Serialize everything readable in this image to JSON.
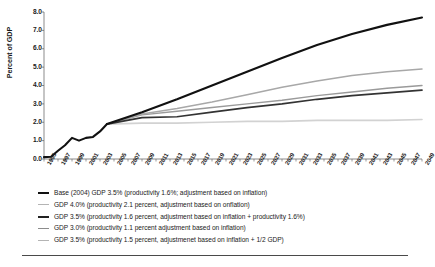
{
  "chart_data": {
    "type": "line",
    "title": "",
    "xlabel": "",
    "ylabel": "Percent of GDP",
    "ylim": [
      0.0,
      8.0
    ],
    "ytick_values": [
      0.0,
      1.0,
      2.0,
      3.0,
      4.0,
      5.0,
      6.0,
      7.0,
      8.0
    ],
    "ytick_labels": [
      "0.0",
      "1.0",
      "2.0",
      "3.0",
      "4.0",
      "5.0",
      "6.0",
      "7.0",
      "8.0"
    ],
    "xlim": [
      1995,
      2049
    ],
    "xtick_labels": [
      "1995",
      "1997",
      "1999",
      "2001",
      "2003",
      "2005",
      "2007",
      "2009",
      "2011",
      "2013",
      "2015",
      "2017",
      "2019",
      "2021",
      "2023",
      "2025",
      "2027",
      "2029",
      "2031",
      "2033",
      "2035",
      "2037",
      "2039",
      "2041",
      "2043",
      "2045",
      "2047",
      "2049"
    ],
    "grid": false,
    "legend_position": "below",
    "historical": {
      "name": "historical",
      "x": [
        1995,
        1996,
        1997,
        1998,
        1999,
        2000,
        2001,
        2002,
        2003,
        2004
      ],
      "values": [
        0.1,
        0.12,
        0.45,
        0.75,
        1.15,
        1.0,
        1.15,
        1.2,
        1.5,
        1.9
      ]
    },
    "series": [
      {
        "name": "Base (2004) GDP 3.5% (productivity 1.6%; adjustment based on inflation)",
        "color": "#111111",
        "width": 2.1,
        "x": [
          2004,
          2009,
          2014,
          2019,
          2024,
          2029,
          2034,
          2039,
          2044,
          2049
        ],
        "values": [
          1.9,
          2.55,
          3.25,
          4.0,
          4.75,
          5.5,
          6.2,
          6.8,
          7.3,
          7.7
        ]
      },
      {
        "name": "GDP 4.0% (productivity 2.1 percent, adjustment based on onflation)",
        "color": "#a8a8a8",
        "width": 1.5,
        "x": [
          2004,
          2009,
          2014,
          2019,
          2024,
          2029,
          2034,
          2039,
          2044,
          2049
        ],
        "values": [
          1.9,
          2.45,
          2.75,
          3.1,
          3.5,
          3.9,
          4.25,
          4.55,
          4.75,
          4.9
        ]
      },
      {
        "name": "GDP 3.5% (productivity 1.6 percent, adjustment based on inflation + productivity 1.6%)",
        "color": "#333333",
        "width": 1.7,
        "x": [
          2004,
          2009,
          2014,
          2019,
          2024,
          2029,
          2034,
          2039,
          2044,
          2049
        ],
        "values": [
          1.9,
          2.25,
          2.3,
          2.55,
          2.8,
          3.0,
          3.25,
          3.45,
          3.6,
          3.75
        ]
      },
      {
        "name": "GDP 3.0% (productivity 1.1 percent adjustment based on inflation)",
        "color": "#9a9a9a",
        "width": 1.4,
        "x": [
          2004,
          2009,
          2014,
          2019,
          2024,
          2029,
          2034,
          2039,
          2044,
          2049
        ],
        "values": [
          1.9,
          2.4,
          2.6,
          2.8,
          3.0,
          3.2,
          3.45,
          3.65,
          3.85,
          4.0
        ]
      },
      {
        "name": "GDP 3.5% (productivity 1.5 percent, adjustmenet based on inflation + 1/2 GDP)",
        "color": "#d2d2d2",
        "width": 1.6,
        "x": [
          2004,
          2009,
          2014,
          2019,
          2024,
          2029,
          2034,
          2039,
          2044,
          2049
        ],
        "values": [
          1.9,
          1.95,
          1.95,
          2.0,
          2.05,
          2.05,
          2.1,
          2.1,
          2.1,
          2.15
        ]
      }
    ]
  },
  "legend": {
    "items": [
      {
        "label": "Base (2004) GDP 3.5% (productivity 1.6%; adjustment based on inflation)",
        "color": "#111111",
        "thickness": 2.4
      },
      {
        "label": "GDP 4.0% (productivity 2.1 percent, adjustment based on onflation)",
        "color": "#b4b4b4",
        "thickness": 1.2
      },
      {
        "label": "GDP 3.5% (productivity 1.6 percent, adjustment based on inflation + productivity 1.6%)",
        "color": "#222222",
        "thickness": 1.9
      },
      {
        "label": "GDP 3.0% (productivity 1.1 percent adjustment based on inflation)",
        "color": "#8c8c8c",
        "thickness": 1.4
      },
      {
        "label": "GDP 3.5% (productivity 1.5 percent, adjustmenet based on inflation + 1/2 GDP)",
        "color": "#b4b4b4",
        "thickness": 1.3
      }
    ]
  },
  "axis": {
    "y_title": "Percent of GDP"
  }
}
